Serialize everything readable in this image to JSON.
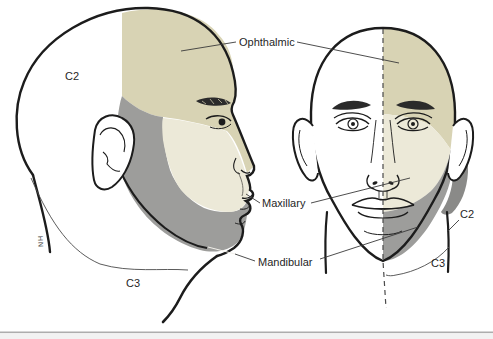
{
  "figure": {
    "title_implicit": "Trigeminal nerve sensory divisions of the head (lateral and frontal views)",
    "labels": {
      "ophthalmic": "Ophthalmic",
      "maxillary": "Maxillary",
      "mandibular": "Mandibular",
      "c2_lateral": "C2",
      "c3_lateral": "C3",
      "c2_frontal": "C2",
      "c3_frontal": "C3",
      "artist_signature": "HN"
    },
    "colors": {
      "ophthalmic": "#d8d3b4",
      "maxillary": "#ece9d8",
      "mandibular": "#9d9d9b",
      "c2_region": "#8a8a88",
      "outline": "#1c1c1c",
      "leader": "#3a3a3a",
      "leader_on_gray": "#f2f0ea",
      "page_edge_line": "#adadad",
      "page_edge_strip": "#f2f2f2"
    },
    "views": [
      "lateral",
      "frontal"
    ]
  }
}
